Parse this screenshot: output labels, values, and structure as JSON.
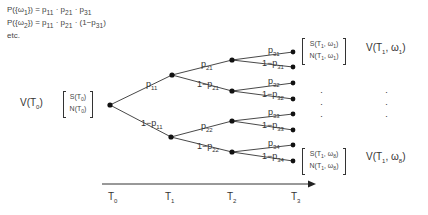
{
  "formulas": [
    {
      "lhs": "P({ω",
      "lhs_sub": "1",
      "rhs": "}) = p",
      "terms": "p11 · p21 · p31",
      "text_parts": [
        "P({ω",
        "1",
        "}) = p",
        "11",
        " · p",
        "21",
        " · p",
        "31",
        ""
      ]
    },
    {
      "lhs": "P({ω",
      "lhs_sub": "2",
      "terms": "p11 · p21 · (1−p31)",
      "text_parts": [
        "P({ω",
        "2",
        "}) = p",
        "11",
        " · p",
        "21",
        " · (1−p",
        "31",
        ")"
      ]
    },
    {
      "text_parts": [
        "etc.",
        "",
        "",
        "",
        "",
        "",
        "",
        "",
        ""
      ]
    }
  ],
  "root": {
    "value_label": [
      "V(T",
      "0",
      ")"
    ],
    "state_box": {
      "line1": [
        "S(T",
        "0",
        ")"
      ],
      "line2": [
        "N(T",
        "0",
        ")"
      ]
    }
  },
  "edges": {
    "t0_up": [
      "p",
      "11"
    ],
    "t0_down": [
      "1−p",
      "11"
    ],
    "t1u_up": [
      "p",
      "21"
    ],
    "t1u_down": [
      "1−p",
      "21"
    ],
    "t1d_up": [
      "p",
      "22"
    ],
    "t1d_down": [
      "1−p",
      "22"
    ],
    "t2_1_up": [
      "p",
      "31"
    ],
    "t2_1_down": [
      "1−p",
      "31"
    ],
    "t2_2_up": [
      "p",
      "32"
    ],
    "t2_2_down": [
      "1−p",
      "32"
    ],
    "t2_3_up": [
      "p",
      "33"
    ],
    "t2_3_down": [
      "1−p",
      "33"
    ],
    "t2_4_up": [
      "p",
      "34"
    ],
    "t2_4_down": [
      "1−p",
      "34"
    ]
  },
  "leaves": {
    "top": {
      "state_box": {
        "line1": [
          "S(T",
          "1",
          ", ω",
          "1",
          ")"
        ],
        "line2": [
          "N(T",
          "1",
          ", ω",
          "1",
          ")"
        ]
      },
      "value_label": [
        "V(T",
        "1",
        ", ω",
        "1",
        ")"
      ]
    },
    "bottom": {
      "state_box": {
        "line1": [
          "S(T",
          "1",
          ", ω",
          "8",
          ")"
        ],
        "line2": [
          "N(T",
          "1",
          ", ω",
          "8",
          ")"
        ]
      },
      "value_label": [
        "V(T",
        "1",
        ", ω",
        "8",
        ")"
      ]
    },
    "ellipsis": "·"
  },
  "time_axis": {
    "ticks": [
      [
        "T",
        "0"
      ],
      [
        "T",
        "1"
      ],
      [
        "T",
        "2"
      ],
      [
        "T",
        "3"
      ]
    ]
  },
  "colors": {
    "line": "#333333",
    "node": "#111111",
    "text": "#333333"
  }
}
